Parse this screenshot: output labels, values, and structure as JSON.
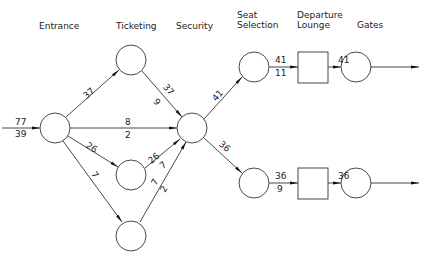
{
  "stages": [
    {
      "label_lines": [
        "Entrance"
      ],
      "x": 56,
      "y": 26
    },
    {
      "label_lines": [
        "Ticketing"
      ],
      "x": 131,
      "y": 26
    },
    {
      "label_lines": [
        "Security"
      ],
      "x": 193,
      "y": 26
    },
    {
      "label_lines": [
        "Seat",
        "Selection"
      ],
      "x": 237,
      "y": 16
    },
    {
      "label_lines": [
        "Departure",
        "Lounge"
      ],
      "x": 297,
      "y": 16
    },
    {
      "label_lines": [
        "Gates"
      ],
      "x": 356,
      "y": 26
    }
  ],
  "nodes": [
    {
      "id": "entrance",
      "shape": "circle",
      "cx": 55,
      "cy": 128,
      "r": 15
    },
    {
      "id": "ticketing-1",
      "shape": "circle",
      "cx": 131,
      "cy": 60,
      "r": 15
    },
    {
      "id": "ticketing-2",
      "shape": "circle",
      "cx": 131,
      "cy": 175,
      "r": 15
    },
    {
      "id": "ticketing-3",
      "shape": "circle",
      "cx": 131,
      "cy": 236,
      "r": 15
    },
    {
      "id": "security",
      "shape": "circle",
      "cx": 192,
      "cy": 128,
      "r": 15
    },
    {
      "id": "seat-1",
      "shape": "circle",
      "cx": 254,
      "cy": 67,
      "r": 15
    },
    {
      "id": "seat-2",
      "shape": "circle",
      "cx": 254,
      "cy": 183,
      "r": 15
    },
    {
      "id": "lounge-1",
      "shape": "square",
      "x": 298,
      "y": 52,
      "w": 30,
      "h": 31
    },
    {
      "id": "lounge-2",
      "shape": "square",
      "x": 298,
      "y": 168,
      "w": 30,
      "h": 31
    },
    {
      "id": "gate-1",
      "shape": "circle",
      "cx": 356,
      "cy": 67,
      "r": 15
    },
    {
      "id": "gate-2",
      "shape": "circle",
      "cx": 356,
      "cy": 183,
      "r": 15
    }
  ],
  "input": {
    "top": "77",
    "bottom": "39"
  },
  "edges": [
    {
      "from": "entrance",
      "to": "ticketing-1",
      "top": "37",
      "bottom": ""
    },
    {
      "from": "entrance",
      "to": "security",
      "top": "8",
      "bottom": "2"
    },
    {
      "from": "entrance",
      "to": "ticketing-2",
      "top": "26",
      "bottom": ""
    },
    {
      "from": "entrance",
      "to": "ticketing-3",
      "top": "7",
      "bottom": ""
    },
    {
      "from": "ticketing-1",
      "to": "security",
      "top": "37",
      "bottom": "9"
    },
    {
      "from": "ticketing-2",
      "to": "security",
      "top": "26",
      "bottom": "7"
    },
    {
      "from": "ticketing-3",
      "to": "security",
      "top": "7",
      "bottom": "2"
    },
    {
      "from": "security",
      "to": "seat-1",
      "top": "41",
      "bottom": ""
    },
    {
      "from": "security",
      "to": "seat-2",
      "top": "36",
      "bottom": ""
    },
    {
      "from": "seat-1",
      "to": "lounge-1",
      "top": "41",
      "bottom": "11"
    },
    {
      "from": "seat-2",
      "to": "lounge-2",
      "top": "36",
      "bottom": "9"
    },
    {
      "from": "lounge-1",
      "to": "gate-1",
      "top": "41",
      "bottom": ""
    },
    {
      "from": "lounge-2",
      "to": "gate-2",
      "top": "36",
      "bottom": ""
    },
    {
      "from": "gate-1",
      "to": "exit",
      "top": "",
      "bottom": ""
    },
    {
      "from": "gate-2",
      "to": "exit",
      "top": "",
      "bottom": ""
    }
  ]
}
